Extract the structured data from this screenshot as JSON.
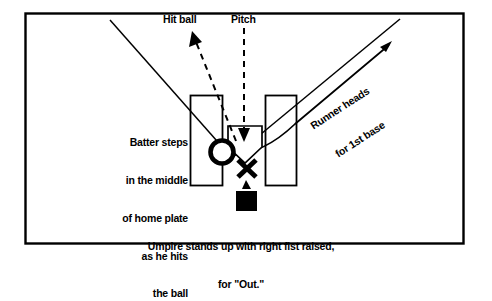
{
  "diagram": {
    "border_color": "#000000",
    "line_color": "#000000",
    "background": "#ffffff",
    "labels": {
      "hit_ball": "Hit ball",
      "pitch": "Pitch",
      "runner_line1": "Runner heads",
      "runner_line2": "for 1st base",
      "batter_note_line1": "Batter steps",
      "batter_note_line2": "in the middle",
      "batter_note_line3": "of home plate",
      "batter_note_line4": "as he hits",
      "batter_note_line5": "the ball",
      "caption_line1": "Umpire stands up with right fist raised,",
      "caption_line2": "for \"Out.\""
    },
    "markers": {
      "batter": "circle-marker",
      "catcher": "x-marker",
      "umpire": "filled-square-marker",
      "home_plate": "home-plate-pentagon",
      "batters_box_left": "batters-box-left",
      "batters_box_right": "batters-box-right"
    }
  }
}
